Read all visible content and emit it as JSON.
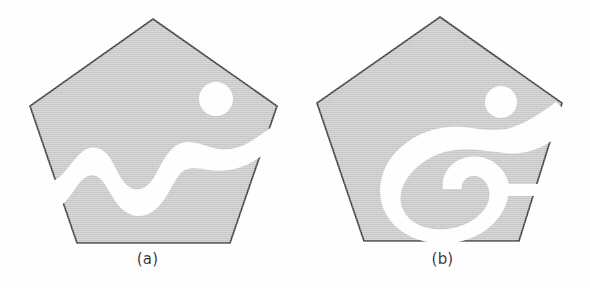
{
  "figure": {
    "background_color": "#fefefe",
    "fill_color": "#c9c9c9",
    "outline_color": "#3c3c3c",
    "hole_color": "#ffffff",
    "caption_color": "#1a1a1a",
    "panels": [
      {
        "id": "a",
        "caption": "(a)",
        "shape": "pentagon",
        "description": "Shaded pentagon split by a wide wavy white band, with a circular white hole in the upper right region",
        "pentagon_vertices": [
          [
            153,
            19
          ],
          [
            277,
            106
          ],
          [
            230,
            243
          ],
          [
            77,
            243
          ],
          [
            30,
            106
          ]
        ],
        "hole": {
          "type": "circle",
          "cx": 216,
          "cy": 99,
          "r": 17
        },
        "cut": {
          "type": "wavy-band",
          "orientation": "diagonal",
          "waves": 3
        }
      },
      {
        "id": "b",
        "caption": "(b)",
        "shape": "pentagon",
        "description": "Shaded pentagon with a large white C-shaped cavity opening to the right edge and a circular white hole in the upper right region",
        "pentagon_vertices": [
          [
            440,
            17
          ],
          [
            562,
            103
          ],
          [
            519,
            241
          ],
          [
            364,
            241
          ],
          [
            317,
            103
          ]
        ],
        "hole": {
          "type": "circle",
          "cx": 501,
          "cy": 102,
          "r": 16
        },
        "cut": {
          "type": "c-shaped-cavity",
          "opens_toward": "right"
        }
      }
    ]
  }
}
